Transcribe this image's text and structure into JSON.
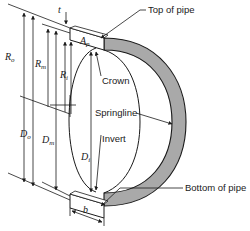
{
  "diagram": {
    "colors": {
      "line": "#1a1a1a",
      "pipe_wall": "#a9a9a9",
      "background": "#ffffff"
    },
    "callouts": {
      "top_of_pipe": "Top of pipe",
      "crown": "Crown",
      "springline": "Springline",
      "invert": "Invert",
      "bottom_of_pipe": "Bottom of pipe"
    },
    "symbols": {
      "t": "t",
      "A_p": {
        "base": "A",
        "sub": "p"
      },
      "R_o": {
        "base": "R",
        "sub": "o"
      },
      "R_m": {
        "base": "R",
        "sub": "m"
      },
      "R_i": {
        "base": "R",
        "sub": "i"
      },
      "D_o": {
        "base": "D",
        "sub": "o"
      },
      "D_m": {
        "base": "D",
        "sub": "m"
      },
      "D_i": {
        "base": "D",
        "sub": "i"
      },
      "b": "b"
    }
  }
}
